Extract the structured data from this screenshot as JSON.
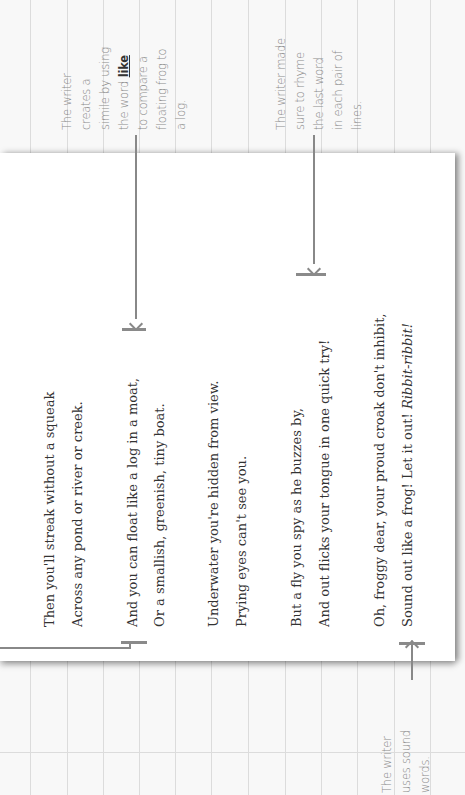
{
  "poem": {
    "lines": [
      "Then you'll streak without a squeak",
      "Across any pond or river or creek.",
      "And you can float like a log in a moat,",
      "Or a smallish, greenish, tiny boat.",
      "Underwater you're hidden from view.",
      "Prying eyes can't see you.",
      "But a fly you spy as he buzzes by,",
      "And out flicks your tongue in one quick try!",
      "Oh, froggy dear, your proud croak don't inhibit,",
      "Sound out like a frog! Let it out!"
    ],
    "last_line_italic": "Ribbit-ribbit!"
  },
  "annotations": {
    "simile": {
      "lines": [
        "The writer",
        "creates a",
        "simile by using",
        "the word ",
        "to compare a",
        "floating frog to",
        "a log."
      ],
      "emphasis": "like"
    },
    "rhyme": {
      "lines": [
        "The writer made",
        "sure to rhyme",
        "the last word",
        "in each pair of",
        "lines."
      ]
    },
    "sound": {
      "lines": [
        "The writer",
        "uses sound",
        "words."
      ]
    }
  },
  "colors": {
    "page": "#ffffff",
    "background": "#f8f8f8",
    "grid": "#dcdcdc",
    "annotation_text": "#8a8a8a",
    "poem_text": "#333333",
    "connector": "#888888"
  }
}
